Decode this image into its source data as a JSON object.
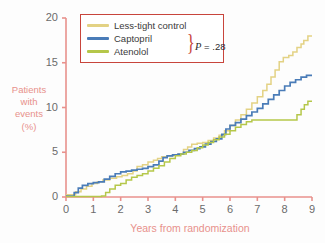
{
  "chart_data": {
    "type": "line",
    "title": "",
    "subtitle": "",
    "xlabel": "Years from randomization",
    "ylabel": "Patients with events (%)",
    "ylabel_lines": [
      "Patients",
      "with",
      "events",
      "(%)"
    ],
    "xlim": [
      0,
      9
    ],
    "ylim": [
      0,
      20
    ],
    "xticks": [
      0,
      1,
      2,
      3,
      4,
      5,
      6,
      7,
      8,
      9
    ],
    "yticks": [
      0,
      5,
      10,
      15,
      20
    ],
    "xtick_labels": [
      "0",
      "1",
      "2",
      "3",
      "4",
      "5",
      "6",
      "7",
      "8",
      "9"
    ],
    "ytick_labels": [
      "0",
      "5",
      "10",
      "15",
      "20"
    ],
    "grid": false,
    "legend_position": "top-left",
    "step_style": "post",
    "annotations": [
      {
        "text": "P = .28",
        "groups": [
          "Captopril",
          "Atenolol"
        ],
        "style": "brace"
      }
    ],
    "series": [
      {
        "name": "Less-tight control",
        "color": "#e3d284",
        "points": [
          [
            0.0,
            0.25
          ],
          [
            0.35,
            0.6
          ],
          [
            0.55,
            0.9
          ],
          [
            0.75,
            1.2
          ],
          [
            0.95,
            1.5
          ],
          [
            1.15,
            1.7
          ],
          [
            1.35,
            1.9
          ],
          [
            1.6,
            2.1
          ],
          [
            1.85,
            2.25
          ],
          [
            2.05,
            2.4
          ],
          [
            2.25,
            2.6
          ],
          [
            2.45,
            2.9
          ],
          [
            2.6,
            3.4
          ],
          [
            2.8,
            3.6
          ],
          [
            3.0,
            3.9
          ],
          [
            3.2,
            4.1
          ],
          [
            3.35,
            4.3
          ],
          [
            3.5,
            4.5
          ],
          [
            3.7,
            4.6
          ],
          [
            3.9,
            4.7
          ],
          [
            4.1,
            4.8
          ],
          [
            4.3,
            5.3
          ],
          [
            4.45,
            5.6
          ],
          [
            4.6,
            5.9
          ],
          [
            4.8,
            6.0
          ],
          [
            5.0,
            6.1
          ],
          [
            5.2,
            6.3
          ],
          [
            5.4,
            6.6
          ],
          [
            5.6,
            6.9
          ],
          [
            5.8,
            7.4
          ],
          [
            6.0,
            8.0
          ],
          [
            6.2,
            8.6
          ],
          [
            6.4,
            9.2
          ],
          [
            6.6,
            9.8
          ],
          [
            6.8,
            10.5
          ],
          [
            7.0,
            11.2
          ],
          [
            7.2,
            11.9
          ],
          [
            7.35,
            12.6
          ],
          [
            7.5,
            13.4
          ],
          [
            7.65,
            14.2
          ],
          [
            7.8,
            15.1
          ],
          [
            7.95,
            15.6
          ],
          [
            8.15,
            15.8
          ],
          [
            8.3,
            16.2
          ],
          [
            8.45,
            16.7
          ],
          [
            8.6,
            17.1
          ],
          [
            8.7,
            17.5
          ],
          [
            8.85,
            18.0
          ],
          [
            9.0,
            18.0
          ]
        ]
      },
      {
        "name": "Captopril",
        "color": "#4a7cb8",
        "points": [
          [
            0.0,
            0.1
          ],
          [
            0.3,
            0.5
          ],
          [
            0.45,
            1.0
          ],
          [
            0.6,
            1.3
          ],
          [
            0.8,
            1.5
          ],
          [
            1.0,
            1.6
          ],
          [
            1.2,
            1.7
          ],
          [
            1.4,
            2.0
          ],
          [
            1.6,
            2.3
          ],
          [
            1.8,
            2.6
          ],
          [
            2.0,
            2.8
          ],
          [
            2.2,
            2.9
          ],
          [
            2.4,
            3.0
          ],
          [
            2.6,
            3.1
          ],
          [
            2.8,
            3.2
          ],
          [
            3.0,
            3.4
          ],
          [
            3.2,
            3.6
          ],
          [
            3.4,
            4.0
          ],
          [
            3.55,
            4.4
          ],
          [
            3.7,
            4.6
          ],
          [
            3.9,
            4.7
          ],
          [
            4.1,
            4.8
          ],
          [
            4.3,
            5.0
          ],
          [
            4.5,
            5.2
          ],
          [
            4.7,
            5.4
          ],
          [
            4.9,
            5.6
          ],
          [
            5.1,
            5.9
          ],
          [
            5.3,
            6.2
          ],
          [
            5.5,
            6.5
          ],
          [
            5.7,
            7.0
          ],
          [
            5.85,
            7.6
          ],
          [
            6.0,
            8.0
          ],
          [
            6.2,
            8.3
          ],
          [
            6.4,
            8.7
          ],
          [
            6.6,
            9.1
          ],
          [
            6.8,
            9.5
          ],
          [
            7.0,
            9.9
          ],
          [
            7.2,
            10.4
          ],
          [
            7.4,
            10.9
          ],
          [
            7.6,
            11.4
          ],
          [
            7.8,
            11.9
          ],
          [
            8.0,
            12.4
          ],
          [
            8.2,
            12.8
          ],
          [
            8.4,
            13.1
          ],
          [
            8.6,
            13.4
          ],
          [
            8.8,
            13.6
          ],
          [
            9.0,
            13.6
          ]
        ]
      },
      {
        "name": "Atenolol",
        "color": "#b5c74a",
        "points": [
          [
            0.0,
            0.05
          ],
          [
            1.3,
            0.1
          ],
          [
            1.45,
            0.5
          ],
          [
            1.6,
            0.9
          ],
          [
            1.8,
            1.3
          ],
          [
            2.0,
            1.5
          ],
          [
            2.2,
            1.9
          ],
          [
            2.4,
            2.2
          ],
          [
            2.6,
            2.4
          ],
          [
            2.8,
            2.6
          ],
          [
            3.0,
            2.9
          ],
          [
            3.2,
            3.2
          ],
          [
            3.4,
            3.5
          ],
          [
            3.6,
            3.9
          ],
          [
            3.8,
            4.3
          ],
          [
            4.0,
            4.6
          ],
          [
            4.2,
            4.8
          ],
          [
            4.4,
            5.0
          ],
          [
            4.6,
            5.2
          ],
          [
            4.8,
            5.5
          ],
          [
            5.0,
            5.8
          ],
          [
            5.2,
            6.1
          ],
          [
            5.4,
            6.4
          ],
          [
            5.6,
            6.7
          ],
          [
            5.8,
            7.0
          ],
          [
            6.0,
            7.4
          ],
          [
            6.2,
            7.8
          ],
          [
            6.4,
            8.1
          ],
          [
            6.6,
            8.4
          ],
          [
            6.8,
            8.6
          ],
          [
            7.0,
            8.6
          ],
          [
            7.6,
            8.6
          ],
          [
            8.0,
            8.6
          ],
          [
            8.3,
            8.6
          ],
          [
            8.45,
            9.2
          ],
          [
            8.6,
            9.8
          ],
          [
            8.72,
            10.3
          ],
          [
            8.85,
            10.7
          ],
          [
            9.0,
            10.7
          ]
        ]
      }
    ]
  },
  "legend": {
    "items": [
      {
        "label": "Less-tight control",
        "color": "#e3d284"
      },
      {
        "label": "Captopril",
        "color": "#4a7cb8"
      },
      {
        "label": "Atenolol",
        "color": "#b5c74a"
      }
    ],
    "brace_glyph": "}",
    "p_prefix": "P",
    "p_rest": " = .28",
    "border_color": "#c8453c"
  },
  "axes": {
    "axis_color": "#e8918c",
    "tick_label_color": "#6b6b6b",
    "title_color": "#e8918c"
  }
}
